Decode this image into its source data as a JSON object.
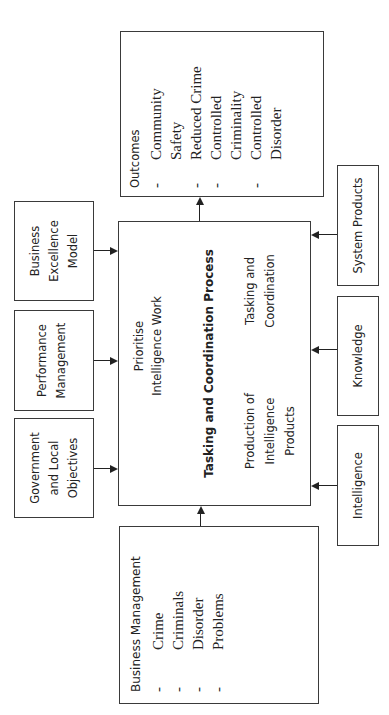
{
  "diagram": {
    "orientation": "rotated -90deg (text reads bottom-to-top)",
    "central_process": {
      "title": "Tasking and Coordination Process",
      "items": [
        "Prioritise",
        "Intelligence Work",
        "Tasking and",
        "Coordination",
        "Production of",
        "Intelligence",
        "Products"
      ]
    },
    "outcomes": {
      "title": "Outcomes",
      "items": [
        {
          "dash": "-",
          "lines": [
            "Community",
            "Safety"
          ]
        },
        {
          "dash": "-",
          "lines": [
            "Reduced Crime"
          ]
        },
        {
          "dash": "-",
          "lines": [
            "Controlled",
            "Criminality"
          ]
        },
        {
          "dash": "-",
          "lines": [
            "Controlled",
            "Disorder"
          ]
        }
      ]
    },
    "business_management": {
      "title": "Business Management",
      "items": [
        {
          "dash": "-",
          "label": "Crime"
        },
        {
          "dash": "-",
          "label": "Criminals"
        },
        {
          "dash": "-",
          "label": "Disorder"
        },
        {
          "dash": "-",
          "label": "Problems"
        }
      ]
    },
    "left_inputs": [
      {
        "lines": [
          "Business",
          "Excellence",
          "Model"
        ]
      },
      {
        "lines": [
          "Performance",
          "Management"
        ]
      },
      {
        "lines": [
          "Government",
          "and Local",
          "Objectives"
        ]
      }
    ],
    "right_inputs": [
      {
        "label": "System Products"
      },
      {
        "label": "Knowledge"
      },
      {
        "label": "Intelligence"
      }
    ],
    "colors": {
      "line": "#222222",
      "border": "#3a3a3a",
      "background": "#ffffff"
    }
  }
}
